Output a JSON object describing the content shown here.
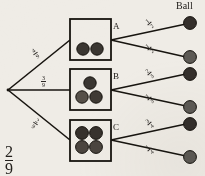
{
  "diagram": {
    "type": "probability-tree",
    "title": "Ball",
    "background_color": "#efece6",
    "root": {
      "label": "2/9",
      "numerator": "2",
      "denominator": "9"
    },
    "branches": [
      {
        "id": "A",
        "box_label": "A",
        "probability": {
          "numerator": "4",
          "denominator": "9"
        },
        "balls_in_box": 2,
        "ball_colors": [
          "#3a3631",
          "#3a3631"
        ],
        "outcomes": [
          {
            "probability": {
              "numerator": "1",
              "denominator": "2"
            },
            "ball_color": "#342f2b"
          },
          {
            "probability": {
              "numerator": "1",
              "denominator": "2"
            },
            "ball_color": "#5d5a55"
          }
        ]
      },
      {
        "id": "B",
        "box_label": "B",
        "probability": {
          "numerator": "3",
          "denominator": "9"
        },
        "balls_in_box": 3,
        "ball_colors": [
          "#3a3631",
          "#565049",
          "#3f3a34"
        ],
        "outcomes": [
          {
            "probability": {
              "numerator": "2",
              "denominator": "3"
            },
            "ball_color": "#342f2b"
          },
          {
            "probability": {
              "numerator": "1",
              "denominator": "3"
            },
            "ball_color": "#5d5a55"
          }
        ]
      },
      {
        "id": "C",
        "box_label": "C",
        "probability": {
          "numerator": "2",
          "denominator": "9"
        },
        "balls_in_box": 4,
        "ball_colors": [
          "#37322d",
          "#37322d",
          "#4b453f",
          "#4b453f"
        ],
        "outcomes": [
          {
            "probability": {
              "numerator": "3",
              "denominator": "4"
            },
            "ball_color": "#342f2b"
          },
          {
            "probability": {
              "numerator": "1",
              "denominator": "4"
            },
            "ball_color": "#5d5a55"
          }
        ]
      }
    ],
    "colors": {
      "line": "#17140f",
      "box_stroke": "#17140f",
      "text": "#1d1a17"
    }
  }
}
